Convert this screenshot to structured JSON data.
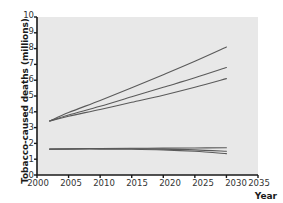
{
  "chart_data": {
    "type": "line",
    "title": "",
    "xlabel": "Year",
    "ylabel": "Tobacco-caused deaths (millions)",
    "xlim": [
      2000,
      2035
    ],
    "ylim": [
      0,
      10
    ],
    "xticks": [
      "2000",
      "2005",
      "2010",
      "2015",
      "2020",
      "2025",
      "2030",
      "2035"
    ],
    "yticks": [
      "0",
      "1",
      "2",
      "3",
      "4",
      "5",
      "6",
      "7",
      "8",
      "9",
      "10"
    ],
    "grid": false,
    "legend_position": "inline-annotation",
    "annotations": [
      {
        "id": "annot-medium",
        "line1": "Medium and low",
        "line2": "income countries"
      },
      {
        "id": "annot-high",
        "line1": "High income",
        "line2": "countries"
      }
    ],
    "x": [
      2002,
      2005,
      2010,
      2015,
      2020,
      2025,
      2030
    ],
    "series": [
      {
        "name": "Medium and low income countries - high projection",
        "group": "Medium and low income countries",
        "color": "#5a5a5a",
        "values": [
          3.42,
          3.95,
          4.72,
          5.52,
          6.35,
          7.2,
          8.1
        ]
      },
      {
        "name": "Medium and low income countries - mid projection",
        "group": "Medium and low income countries",
        "color": "#5a5a5a",
        "values": [
          3.42,
          3.8,
          4.35,
          4.95,
          5.55,
          6.15,
          6.8
        ]
      },
      {
        "name": "Medium and low income countries - low projection",
        "group": "Medium and low income countries",
        "color": "#5a5a5a",
        "values": [
          3.42,
          3.72,
          4.15,
          4.6,
          5.05,
          5.55,
          6.1
        ]
      },
      {
        "name": "High income countries - high projection",
        "group": "High income countries",
        "color": "#5a5a5a",
        "values": [
          1.65,
          1.66,
          1.68,
          1.69,
          1.7,
          1.71,
          1.72
        ]
      },
      {
        "name": "High income countries - mid projection",
        "group": "High income countries",
        "color": "#5a5a5a",
        "values": [
          1.64,
          1.65,
          1.66,
          1.66,
          1.64,
          1.59,
          1.5
        ]
      },
      {
        "name": "High income countries - low projection",
        "group": "High income countries",
        "color": "#5a5a5a",
        "values": [
          1.63,
          1.64,
          1.64,
          1.63,
          1.59,
          1.5,
          1.35
        ]
      }
    ]
  },
  "style": {
    "plot_background": "#e8e8e8",
    "page_background": "#ffffff",
    "axis_color": "#1a1a1a",
    "line_color": "#5a5a5a"
  }
}
